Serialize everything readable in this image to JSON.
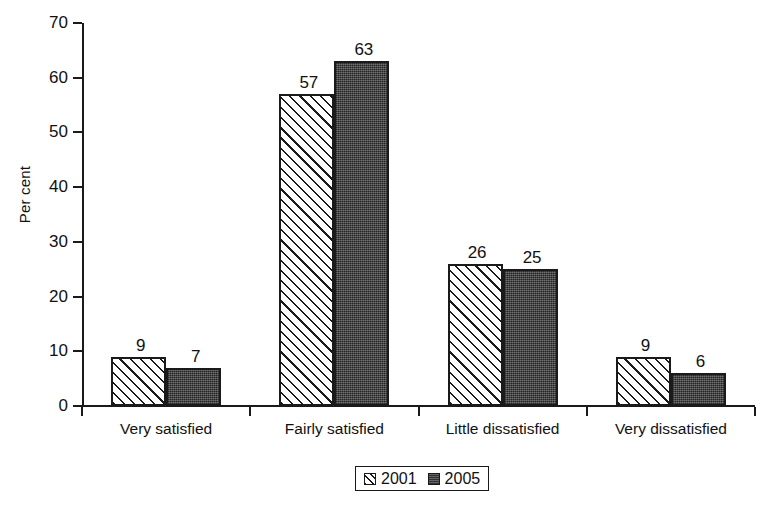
{
  "chart_data": {
    "type": "bar",
    "title": "",
    "subtitle": "",
    "xlabel": "",
    "ylabel": "Per cent",
    "ylim": [
      0,
      70
    ],
    "yticks": [
      0,
      10,
      20,
      30,
      40,
      50,
      60,
      70
    ],
    "ytick_labels": [
      "0",
      "10",
      "20",
      "30",
      "40",
      "50",
      "60",
      "70"
    ],
    "grid": false,
    "legend_position": "bottom-center",
    "categories": [
      "Very satisfied",
      "Fairly satisfied",
      "Little dissatisfied",
      "Very dissatisfied"
    ],
    "series": [
      {
        "name": "2001",
        "fill": "diagonal-hatch",
        "color": "#ffffff",
        "edge_color": "#1a1a1a",
        "values": [
          9,
          57,
          26,
          9
        ],
        "value_labels": [
          "9",
          "57",
          "26",
          "9"
        ]
      },
      {
        "name": "2005",
        "fill": "solid-dither",
        "color": "#4a4a4a",
        "edge_color": "#1a1a1a",
        "values": [
          7,
          63,
          25,
          6
        ],
        "value_labels": [
          "7",
          "63",
          "25",
          "6"
        ]
      }
    ]
  },
  "legend": {
    "items": [
      {
        "label": "2001"
      },
      {
        "label": "2005"
      }
    ]
  }
}
